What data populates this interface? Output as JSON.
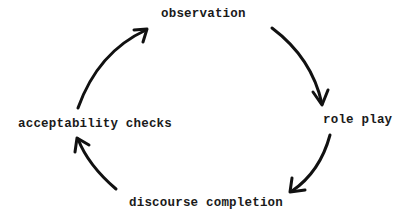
{
  "diagram": {
    "type": "cycle",
    "nodes": [
      {
        "id": "observation",
        "label": "observation",
        "position": "top"
      },
      {
        "id": "role-play",
        "label": "role play",
        "position": "right"
      },
      {
        "id": "discourse-completion",
        "label": "discourse completion",
        "position": "bottom"
      },
      {
        "id": "acceptability-checks",
        "label": "acceptability checks",
        "position": "left"
      }
    ],
    "edges": [
      {
        "from": "observation",
        "to": "role-play"
      },
      {
        "from": "role-play",
        "to": "discourse-completion"
      },
      {
        "from": "discourse-completion",
        "to": "acceptability-checks"
      },
      {
        "from": "acceptability-checks",
        "to": "observation"
      }
    ],
    "direction": "clockwise"
  }
}
